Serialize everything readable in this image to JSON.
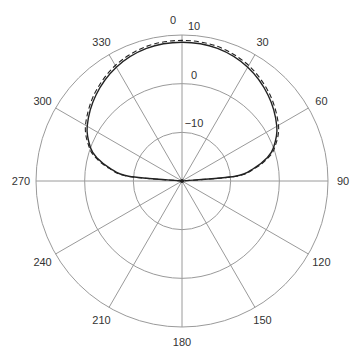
{
  "chart_data": {
    "type": "polar",
    "title": "",
    "angle_unit": "degrees",
    "angle_zero": "top",
    "angle_direction": "clockwise",
    "angle_ticks": [
      0,
      30,
      60,
      90,
      120,
      150,
      180,
      210,
      240,
      270,
      300,
      330
    ],
    "angle_tick_labels": [
      "0",
      "30",
      "60",
      "90",
      "120",
      "150",
      "180",
      "210",
      "240",
      "270",
      "300",
      "330"
    ],
    "radial_range": [
      -20,
      10
    ],
    "radial_ticks": [
      -10,
      0,
      10
    ],
    "radial_tick_labels": [
      "−10",
      "0",
      "10"
    ],
    "grid": true,
    "legend": null,
    "series": [
      {
        "name": "solid",
        "style": "solid",
        "color": "#222222",
        "angles": [
          -90,
          -85,
          -80,
          -75,
          -70,
          -60,
          -45,
          -30,
          -15,
          0,
          15,
          30,
          45,
          60,
          70,
          75,
          80,
          85,
          90
        ],
        "values": [
          -20,
          -9,
          -5,
          -2,
          0,
          2.5,
          5,
          7,
          8.2,
          8.5,
          8.2,
          7,
          5,
          2.5,
          0,
          -2,
          -5,
          -9,
          -20
        ]
      },
      {
        "name": "dashed",
        "style": "dashed",
        "color": "#222222",
        "angles": [
          -90,
          -85,
          -80,
          -75,
          -70,
          -60,
          -45,
          -30,
          -15,
          0,
          15,
          30,
          45,
          60,
          70,
          75,
          80,
          85,
          90
        ],
        "values": [
          -20,
          -8.8,
          -4.7,
          -1.7,
          0.3,
          2.9,
          5.4,
          7.4,
          8.6,
          8.9,
          8.6,
          7.4,
          5.4,
          2.9,
          0.3,
          -1.7,
          -4.7,
          -8.8,
          -20
        ]
      }
    ]
  }
}
